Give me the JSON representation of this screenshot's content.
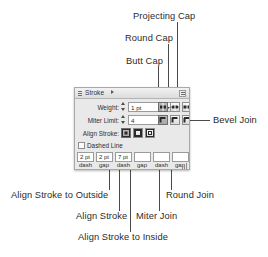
{
  "figure": {
    "kind": "annotated-screenshot"
  },
  "panel": {
    "title": "Stroke",
    "rows": {
      "weight_label": "Weight:",
      "weight_value": "1 pt",
      "miter_label": "Miter Limit:",
      "miter_value": "4",
      "miter_unit": "x",
      "align_label": "Align Stroke:",
      "dashed_label": "Dashed Line",
      "dashed_checked": false
    },
    "dash_fields": [
      {
        "value": "2 pt",
        "caption": "dash"
      },
      {
        "value": "2 pt",
        "caption": "gap"
      },
      {
        "value": "7 pt",
        "caption": "dash"
      },
      {
        "value": "",
        "caption": "gap"
      },
      {
        "value": "",
        "caption": "dash"
      },
      {
        "value": "",
        "caption": "gap"
      }
    ],
    "cap_buttons": [
      {
        "name": "butt-cap",
        "selected": true
      },
      {
        "name": "round-cap",
        "selected": false
      },
      {
        "name": "projecting-cap",
        "selected": false
      }
    ],
    "join_buttons": [
      {
        "name": "miter-join",
        "selected": true
      },
      {
        "name": "round-join",
        "selected": false
      },
      {
        "name": "bevel-join",
        "selected": false
      }
    ],
    "align_buttons": [
      {
        "name": "align-stroke-to-center",
        "selected": true
      },
      {
        "name": "align-stroke-to-inside",
        "selected": false
      },
      {
        "name": "align-stroke-to-outside",
        "selected": false
      }
    ]
  },
  "callouts": {
    "projecting_cap": "Projecting Cap",
    "round_cap": "Round Cap",
    "butt_cap": "Butt Cap",
    "bevel_join": "Bevel Join",
    "align_outside": "Align Stroke to Outside",
    "round_join": "Round Join",
    "align_stroke": "Align Stroke",
    "miter_join": "Miter Join",
    "align_inside": "Align Stroke to Inside"
  },
  "colors": {
    "text": "#2b2b2b",
    "leader": "#4a4a4a",
    "panel_bg": "#e9e9e9",
    "panel_border": "#a9a9a9",
    "field_bg": "#ffffff"
  }
}
